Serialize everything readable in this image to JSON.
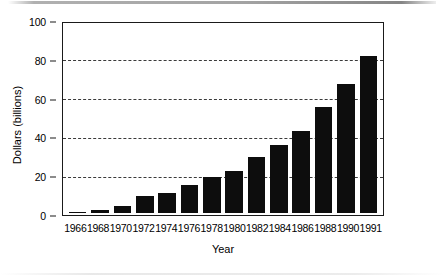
{
  "chart_data": {
    "type": "bar",
    "title": "",
    "subtitle": "",
    "xlabel": "Year",
    "ylabel": "Dollars (billions)",
    "categories": [
      "1966",
      "1968",
      "1970",
      "1972",
      "1974",
      "1976",
      "1978",
      "1980",
      "1982",
      "1984",
      "1986",
      "1988",
      "1990",
      "1991"
    ],
    "values": [
      1.0,
      1.8,
      4.0,
      9.0,
      11.0,
      15.0,
      19.5,
      22.5,
      30.0,
      36.0,
      43.5,
      56.5,
      68.5,
      83.5
    ],
    "ylim": [
      0,
      100
    ],
    "yticks": [
      0,
      20,
      40,
      60,
      80,
      100
    ],
    "ytick_labels": [
      "0",
      "20",
      "40",
      "60",
      "80",
      "100"
    ],
    "gridlines_at": [
      20,
      40,
      60,
      80
    ],
    "grid": "horizontal-dashed",
    "legend": "none",
    "bar_color": "#0d0d0d",
    "axis_color": "#1a1a1a",
    "grid_color": "#3a3a3a",
    "background": "#ffffff"
  }
}
